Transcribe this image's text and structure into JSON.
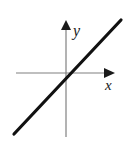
{
  "figure": {
    "name": "coordinate-plane-line-graph",
    "width": 128,
    "height": 149,
    "background_color": "#ffffff"
  },
  "axes": {
    "x_axis": {
      "label": "x",
      "label_x": 105,
      "label_y": 90,
      "color": "#808080",
      "stroke_width": 1.2,
      "x_start": 16,
      "x_end": 104,
      "y": 73,
      "arrow": {
        "name": "x-axis-arrowhead",
        "points": "104,68 115,73 104,78",
        "color": "#1a1a1a"
      }
    },
    "y_axis": {
      "label": "y",
      "label_x": 73,
      "label_y": 36,
      "color": "#808080",
      "stroke_width": 1.2,
      "x": 66,
      "y_start": 137,
      "y_end": 29,
      "arrow": {
        "name": "y-axis-arrowhead",
        "points": "61,30 66,20 71,30",
        "color": "#1a1a1a"
      }
    }
  },
  "chart_data": {
    "type": "line",
    "title": "",
    "subtitle": "",
    "xlabel": "x",
    "ylabel": "y",
    "grid": false,
    "legend": null,
    "annotations": [],
    "origin_px": [
      66,
      73
    ],
    "xlim": [
      -66,
      62
    ],
    "ylim": [
      -76,
      73
    ],
    "series": [
      {
        "name": "line",
        "description": "straight line through the origin with positive slope approximately 1",
        "slope": 1.07,
        "intercept": 0,
        "color": "#111111",
        "stroke_width": 3.2,
        "endpoints_px": [
          [
            14,
            134
          ],
          [
            121,
            20
          ]
        ],
        "x": [
          -52,
          55
        ],
        "y": [
          -61,
          53
        ]
      }
    ]
  },
  "labels": {
    "x_label_text": "x",
    "y_label_text": "y",
    "x_label_font_size": 15,
    "y_label_font_size": 16,
    "label_color": "#1a1a1a"
  }
}
